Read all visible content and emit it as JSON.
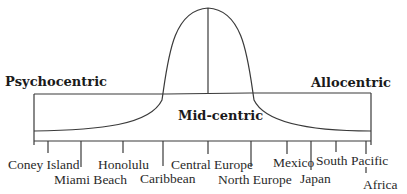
{
  "diagram": {
    "type": "plog-psychographic-continuum",
    "labels": {
      "left_pole": "Psychocentric",
      "right_pole": "Allocentric",
      "center": "Mid-centric"
    },
    "destinations": [
      {
        "name": "Coney Island",
        "row": 1
      },
      {
        "name": "Miami Beach",
        "row": 2
      },
      {
        "name": "Honolulu",
        "row": 1
      },
      {
        "name": "Caribbean",
        "row": 2
      },
      {
        "name": "Central Europe",
        "row": 1
      },
      {
        "name": "North Europe",
        "row": 2
      },
      {
        "name": "Mexico",
        "row": 1
      },
      {
        "name": "Japan",
        "row": 2
      },
      {
        "name": "South Pacific",
        "row": 1
      },
      {
        "name": "Africa",
        "row": 3
      }
    ],
    "colors": {
      "line": "#3a3a3a",
      "text": "#2a2a2a",
      "background": "#ffffff"
    }
  }
}
